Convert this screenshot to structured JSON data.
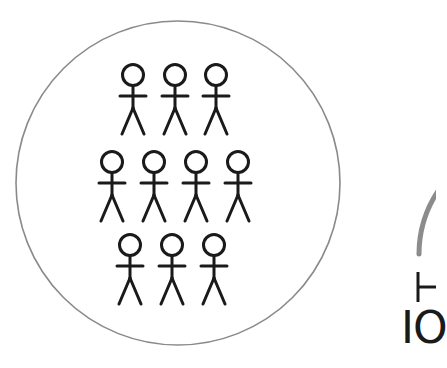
{
  "diagram": {
    "group_circle": {
      "stroke": "#8a8a8a",
      "cx": 178,
      "cy": 183,
      "r": 162
    },
    "figures": {
      "color": "#1a1a1a",
      "rows": [
        {
          "count": 3,
          "x": [
            133,
            175,
            216
          ],
          "head_y": 75
        },
        {
          "count": 4,
          "x": [
            112,
            154,
            196,
            238
          ],
          "head_y": 162
        },
        {
          "count": 3,
          "x": [
            130,
            172,
            214
          ],
          "head_y": 245
        }
      ],
      "total": 10
    },
    "partial_arc": {
      "stroke": "#8c8c8c"
    },
    "partial_label": {
      "text": "IO",
      "symbol": "⊢"
    }
  }
}
